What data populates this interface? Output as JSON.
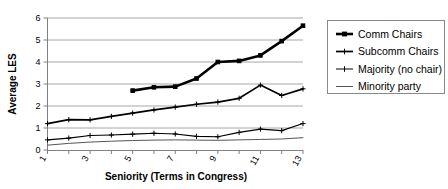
{
  "chart_data": {
    "type": "line",
    "title": "",
    "xlabel": "Seniority (Terms in Congress)",
    "ylabel": "Average LES",
    "xlim": [
      1,
      13
    ],
    "ylim": [
      0,
      6
    ],
    "grid": "horizontal",
    "legend_position": "right",
    "x": [
      1,
      2,
      3,
      4,
      5,
      6,
      7,
      8,
      9,
      10,
      11,
      12,
      13
    ],
    "xticks": [
      1,
      2,
      3,
      4,
      5,
      6,
      7,
      8,
      9,
      10,
      11,
      12,
      13
    ],
    "xtick_labels": [
      "1",
      "",
      "3",
      "",
      "5",
      "",
      "7",
      "",
      "9",
      "",
      "11",
      "",
      "13"
    ],
    "yticks": [
      0,
      1,
      2,
      3,
      4,
      5,
      6
    ],
    "ytick_labels": [
      "0",
      "1",
      "2",
      "3",
      "4",
      "5",
      "6"
    ],
    "series": [
      {
        "name": "Comm Chairs",
        "marker": "square",
        "line_width": "thick",
        "x": [
          5,
          6,
          7,
          8,
          9,
          10,
          11,
          12,
          13
        ],
        "values": [
          2.7,
          2.85,
          2.88,
          3.25,
          4.0,
          4.05,
          4.3,
          4.95,
          5.65
        ]
      },
      {
        "name": "Subcomm Chairs",
        "marker": "plus",
        "line_width": "medium",
        "x": [
          1,
          2,
          3,
          4,
          5,
          6,
          7,
          8,
          9,
          10,
          11,
          12,
          13
        ],
        "values": [
          1.2,
          1.38,
          1.37,
          1.53,
          1.68,
          1.82,
          1.95,
          2.08,
          2.18,
          2.35,
          2.95,
          2.48,
          2.78
        ]
      },
      {
        "name": "Majority (no chair)",
        "marker": "plus",
        "line_width": "thin",
        "x": [
          1,
          2,
          3,
          4,
          5,
          6,
          7,
          8,
          9,
          10,
          11,
          12,
          13
        ],
        "values": [
          0.46,
          0.54,
          0.66,
          0.68,
          0.72,
          0.76,
          0.73,
          0.62,
          0.6,
          0.8,
          0.95,
          0.88,
          1.2
        ]
      },
      {
        "name": "Minority party",
        "marker": "none",
        "line_width": "thin",
        "x": [
          1,
          2,
          3,
          4,
          5,
          6,
          7,
          8,
          9,
          10,
          11,
          12,
          13
        ],
        "values": [
          0.22,
          0.3,
          0.36,
          0.4,
          0.43,
          0.45,
          0.46,
          0.45,
          0.44,
          0.46,
          0.48,
          0.5,
          0.56
        ]
      }
    ]
  },
  "legend": {
    "items": [
      {
        "label": "Comm Chairs"
      },
      {
        "label": "Subcomm Chairs"
      },
      {
        "label": "Majority (no chair)"
      },
      {
        "label": "Minority party"
      }
    ]
  },
  "caption": {
    "text": ""
  }
}
